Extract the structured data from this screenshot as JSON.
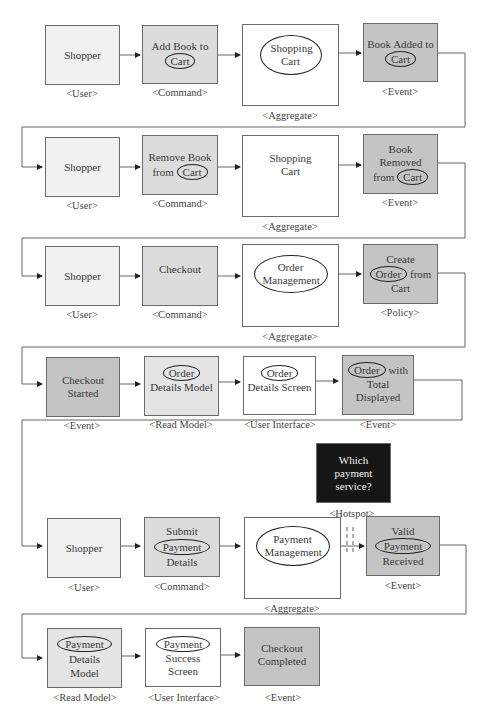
{
  "diagram": {
    "type_labels": {
      "user": "<User>",
      "command": "<Command>",
      "aggregate": "<Aggregate>",
      "event": "<Event>",
      "policy": "<Policy>",
      "read_model": "<Read Model>",
      "user_interface": "<User Interface>",
      "hotspot": "<Hotspot>"
    },
    "rows": [
      {
        "notes": [
          {
            "kind": "user",
            "pre": "Shopper",
            "circled": "",
            "post": ""
          },
          {
            "kind": "command",
            "pre": "Add Book to",
            "circled": "Cart",
            "post": ""
          },
          {
            "kind": "aggregate",
            "pre": "",
            "circled": "Shopping Cart",
            "post": ""
          },
          {
            "kind": "event",
            "pre": "Book Added to",
            "circled": "Cart",
            "post": ""
          }
        ]
      },
      {
        "notes": [
          {
            "kind": "user",
            "pre": "Shopper",
            "circled": "",
            "post": ""
          },
          {
            "kind": "command",
            "pre": "Remove Book from",
            "circled": "Cart",
            "post": ""
          },
          {
            "kind": "aggregate",
            "pre": "Shopping Cart",
            "circled": "",
            "post": ""
          },
          {
            "kind": "event",
            "pre": "Book Removed from",
            "circled": "Cart",
            "post": ""
          }
        ]
      },
      {
        "notes": [
          {
            "kind": "user",
            "pre": "Shopper",
            "circled": "",
            "post": ""
          },
          {
            "kind": "command",
            "pre": "Checkout",
            "circled": "",
            "post": ""
          },
          {
            "kind": "aggregate",
            "pre": "",
            "circled": "Order Management",
            "post": ""
          },
          {
            "kind": "policy",
            "pre": "Create",
            "circled": "Order",
            "post": "from Cart"
          }
        ]
      },
      {
        "notes": [
          {
            "kind": "event",
            "pre": "Checkout Started",
            "circled": "",
            "post": ""
          },
          {
            "kind": "read_model",
            "pre": "",
            "circled": "Order",
            "post": "Details Model"
          },
          {
            "kind": "user_interface",
            "pre": "",
            "circled": "Order",
            "post": "Details Screen"
          },
          {
            "kind": "event",
            "pre": "",
            "circled": "Order",
            "post": "with Total Displayed"
          }
        ]
      },
      {
        "notes": [
          {
            "kind": "user",
            "pre": "Shopper",
            "circled": "",
            "post": ""
          },
          {
            "kind": "command",
            "pre": "Submit",
            "circled": "Payment",
            "post": "Details"
          },
          {
            "kind": "aggregate",
            "pre": "",
            "circled": "Payment Management",
            "post": ""
          },
          {
            "kind": "event",
            "pre": "Valid",
            "circled": "Payment",
            "post": "Received"
          }
        ],
        "hotspot": {
          "text": "Which payment service?"
        }
      },
      {
        "notes": [
          {
            "kind": "read_model",
            "pre": "",
            "circled": "Payment",
            "post": "Details Model"
          },
          {
            "kind": "user_interface",
            "pre": "",
            "circled": "Payment",
            "post": "Success Screen"
          },
          {
            "kind": "event",
            "pre": "Checkout Completed",
            "circled": "",
            "post": ""
          }
        ]
      }
    ]
  }
}
